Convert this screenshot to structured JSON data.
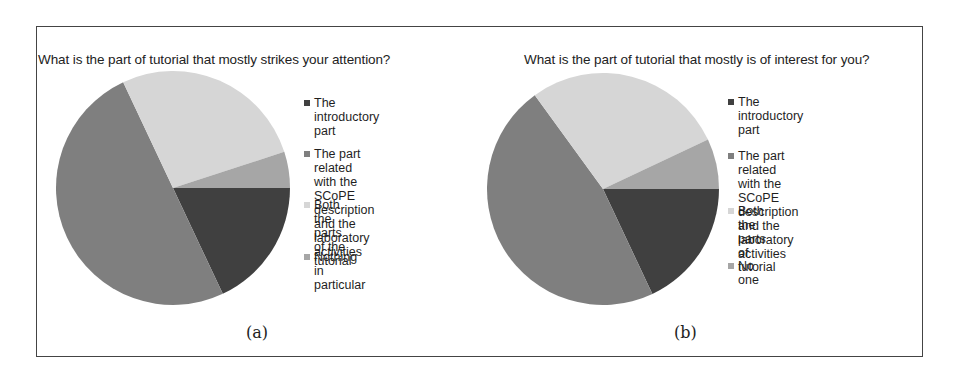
{
  "chart_data": [
    {
      "type": "pie",
      "title": "What is the part of tutorial that mostly strikes your attention?",
      "caption": "(a)",
      "categories": [
        "The introductory part",
        "The part related with the SCoPE description and the laboratory activities",
        "Both the parts of the tutorial",
        "Nothing in particular"
      ],
      "values": [
        18,
        50,
        27,
        5
      ],
      "unit": "% (estimated)",
      "colors": [
        "#404040",
        "#7f7f7f",
        "#d6d6d6",
        "#a6a6a6"
      ],
      "legend_position": "right",
      "start_angle_deg": 0,
      "direction": "clockwise"
    },
    {
      "type": "pie",
      "title": "What is the part of tutorial that mostly is of interest for you?",
      "caption": "(b)",
      "categories": [
        "The introductory part",
        "The part related with the SCoPE description and the laboratory activities",
        "Both the parts of tutorial",
        "No one"
      ],
      "values": [
        18,
        47,
        28,
        7
      ],
      "unit": "% (estimated)",
      "colors": [
        "#404040",
        "#7f7f7f",
        "#d6d6d6",
        "#a6a6a6"
      ],
      "legend_position": "right",
      "start_angle_deg": 0,
      "direction": "clockwise"
    }
  ],
  "figure": {
    "a": {
      "title": "What is the part of tutorial that mostly strikes your attention?",
      "caption": "(a)",
      "legend": [
        {
          "label": "The introductory part",
          "color": "#404040"
        },
        {
          "label": "The part related with the\nSCoPE description and the\nlaboratory activities",
          "color": "#7f7f7f"
        },
        {
          "label": "Both the parts of the\ntutorial",
          "color": "#d6d6d6"
        },
        {
          "label": "Nothing in particular",
          "color": "#a6a6a6"
        }
      ]
    },
    "b": {
      "title": "What is the part of tutorial that mostly is of interest for you?",
      "caption": "(b)",
      "legend": [
        {
          "label": "The introductory part",
          "color": "#404040"
        },
        {
          "label": "The part related with the\nSCoPE description and the\nlaboratory activities",
          "color": "#7f7f7f"
        },
        {
          "label": "Both the parts of tutorial",
          "color": "#d6d6d6"
        },
        {
          "label": "No one",
          "color": "#a6a6a6"
        }
      ]
    }
  }
}
